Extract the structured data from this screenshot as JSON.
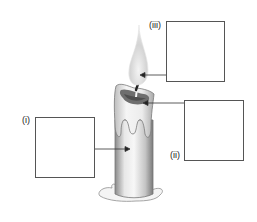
{
  "diagram": {
    "labels": [
      {
        "id": "i",
        "text": "(i)",
        "points_to": "candle-body"
      },
      {
        "id": "ii",
        "text": "(ii)",
        "points_to": "molten-wax-pool"
      },
      {
        "id": "iii",
        "text": "(iii)",
        "points_to": "flame"
      }
    ],
    "answer_boxes": [
      {
        "id": "i",
        "value": ""
      },
      {
        "id": "ii",
        "value": ""
      },
      {
        "id": "iii",
        "value": ""
      }
    ],
    "colors": {
      "box_border": "#555555",
      "arrow": "#333333",
      "wax_light": "#f2f2f2",
      "wax_shadow": "#9a9a9a",
      "flame": "#d9d9d9"
    }
  }
}
